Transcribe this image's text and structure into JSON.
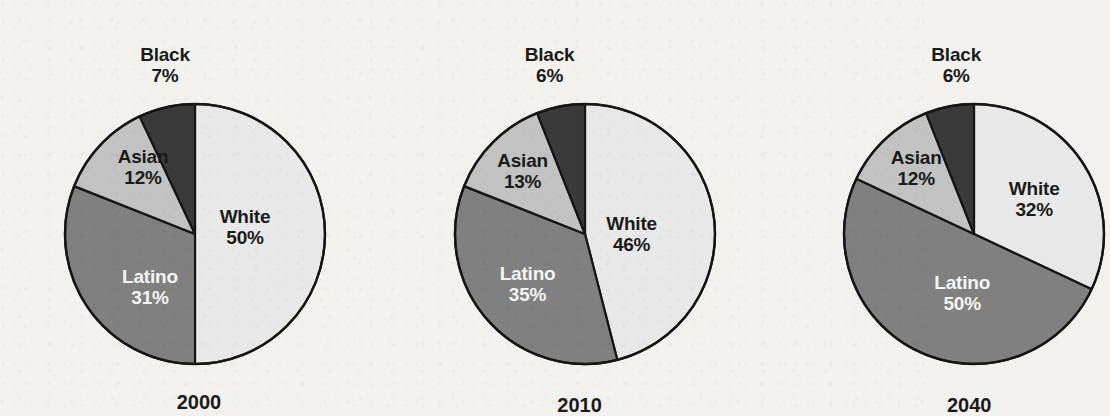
{
  "figure": {
    "background_color": "#f3f1ed",
    "chart_count": 3
  },
  "palette": {
    "white_slice": "#e8e8e8",
    "latino_slice": "#808080",
    "asian_slice": "#c2c2c2",
    "black_slice": "#3a3a3a",
    "outline": "#151515",
    "dark_text": "#1b1b1b",
    "light_text": "#f4f4f4"
  },
  "chart_data": [
    {
      "type": "pie",
      "title": "2000",
      "xlabel": "",
      "ylabel": "",
      "categories": [
        "White",
        "Latino",
        "Asian",
        "Black"
      ],
      "values": [
        50,
        31,
        12,
        7
      ],
      "labels": [
        "50%",
        "31%",
        "12%",
        "7%"
      ],
      "colors": [
        "#e8e8e8",
        "#808080",
        "#c2c2c2",
        "#3a3a3a"
      ],
      "start_angle_deg": 0,
      "direction": "clockwise",
      "legend": "none",
      "grid": false
    },
    {
      "type": "pie",
      "title": "2010",
      "xlabel": "",
      "ylabel": "",
      "categories": [
        "White",
        "Latino",
        "Asian",
        "Black"
      ],
      "values": [
        46,
        35,
        13,
        6
      ],
      "labels": [
        "46%",
        "35%",
        "13%",
        "6%"
      ],
      "colors": [
        "#e8e8e8",
        "#808080",
        "#c2c2c2",
        "#3a3a3a"
      ],
      "start_angle_deg": 0,
      "direction": "clockwise",
      "legend": "none",
      "grid": false
    },
    {
      "type": "pie",
      "title": "2040",
      "xlabel": "",
      "ylabel": "",
      "categories": [
        "White",
        "Latino",
        "Asian",
        "Black"
      ],
      "values": [
        32,
        50,
        12,
        6
      ],
      "labels": [
        "32%",
        "50%",
        "12%",
        "6%"
      ],
      "colors": [
        "#e8e8e8",
        "#808080",
        "#c2c2c2",
        "#3a3a3a"
      ],
      "start_angle_deg": 0,
      "direction": "clockwise",
      "legend": "none",
      "grid": false
    }
  ],
  "charts": [
    {
      "year": "2000",
      "slices": {
        "white": {
          "name": "White",
          "pct": "50%"
        },
        "latino": {
          "name": "Latino",
          "pct": "31%"
        },
        "asian": {
          "name": "Asian",
          "pct": "12%"
        },
        "black": {
          "name": "Black",
          "pct": "7%"
        }
      }
    },
    {
      "year": "2010",
      "slices": {
        "white": {
          "name": "White",
          "pct": "46%"
        },
        "latino": {
          "name": "Latino",
          "pct": "35%"
        },
        "asian": {
          "name": "Asian",
          "pct": "13%"
        },
        "black": {
          "name": "Black",
          "pct": "6%"
        }
      }
    },
    {
      "year": "2040",
      "slices": {
        "white": {
          "name": "White",
          "pct": "32%"
        },
        "latino": {
          "name": "Latino",
          "pct": "50%"
        },
        "asian": {
          "name": "Asian",
          "pct": "12%"
        },
        "black": {
          "name": "Black",
          "pct": "6%"
        }
      }
    }
  ]
}
